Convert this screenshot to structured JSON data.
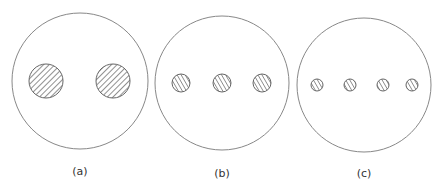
{
  "figure": {
    "stroke_color": "#888888",
    "hatch_color": "#555555",
    "panels": [
      {
        "label": "(a)",
        "outer_circle": {
          "cx": 80,
          "cy": 81,
          "r": 68
        },
        "inclusions": [
          {
            "cx": 46,
            "cy": 81,
            "r": 17
          },
          {
            "cx": 113,
            "cy": 81,
            "r": 17
          }
        ],
        "hatch_direction": "top-left to bottom-right",
        "label_pos": {
          "x": 80,
          "y": 175
        }
      },
      {
        "label": "(b)",
        "outer_circle": {
          "cx": 222,
          "cy": 83,
          "r": 67
        },
        "inclusions": [
          {
            "cx": 181,
            "cy": 83,
            "r": 9
          },
          {
            "cx": 222,
            "cy": 83,
            "r": 9
          },
          {
            "cx": 262,
            "cy": 83,
            "r": 9
          }
        ],
        "hatch_direction": "bottom-left to top-right",
        "label_pos": {
          "x": 222,
          "y": 177
        }
      },
      {
        "label": "(c)",
        "outer_circle": {
          "cx": 364,
          "cy": 85,
          "r": 67
        },
        "inclusions": [
          {
            "cx": 317,
            "cy": 85,
            "r": 6
          },
          {
            "cx": 350,
            "cy": 85,
            "r": 6
          },
          {
            "cx": 383,
            "cy": 85,
            "r": 6
          },
          {
            "cx": 412,
            "cy": 85,
            "r": 6
          }
        ],
        "hatch_direction": "bottom-left to top-right",
        "label_pos": {
          "x": 364,
          "y": 177
        }
      }
    ]
  }
}
